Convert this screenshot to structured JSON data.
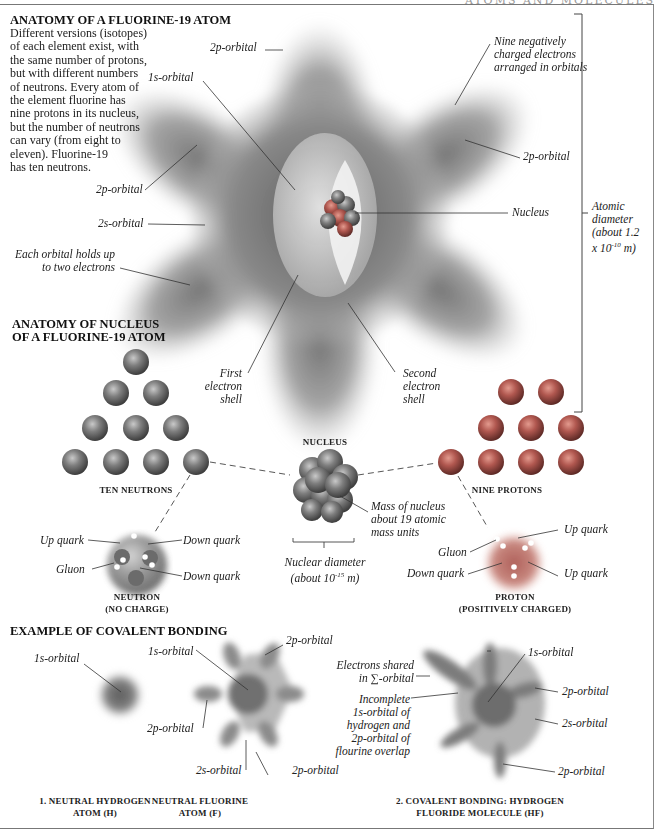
{
  "page": {
    "running_header": "ATOMS AND MOLECULES"
  },
  "atom_section": {
    "title": "ANATOMY OF A FLUORINE-19 ATOM",
    "description_lines": [
      "Different versions (isotopes)",
      "of each element exist, with",
      "the same number of protons,",
      "but with different numbers",
      "of neutrons. Every atom of",
      "the element fluorine has",
      "nine protons in its nucleus,",
      "but the number of neutrons",
      "can vary (from eight to",
      "eleven). Fluorine-19",
      "has ten neutrons."
    ],
    "labels": {
      "p2_top": "2p-orbital",
      "s1": "1s-orbital",
      "electrons": [
        "Nine negatively",
        "charged electrons",
        "arranged in orbitals"
      ],
      "p2_right": "2p-orbital",
      "p2_left": "2p-orbital",
      "s2": "2s-orbital",
      "nucleus": "Nucleus",
      "each_orbital": [
        "Each orbital holds up",
        "to two electrons"
      ],
      "first_shell": [
        "First",
        "electron",
        "shell"
      ],
      "second_shell": [
        "Second",
        "electron",
        "shell"
      ],
      "diameter": [
        "Atomic",
        "diameter",
        "(about 1.2",
        "x 10",
        "-10",
        " m)"
      ]
    }
  },
  "nucleus_section": {
    "title_lines": [
      "ANATOMY OF NUCLEUS",
      "OF A FLUORINE-19 ATOM"
    ],
    "neutrons_caption": "TEN NEUTRONS",
    "protons_caption": "NINE PROTONS",
    "nucleus_caption": "NUCLEUS",
    "mass_label": [
      "Mass of nucleus",
      "about 19 atomic",
      "mass units"
    ],
    "diameter_label": [
      "Nuclear diameter",
      "(about 10",
      "-15",
      " m)"
    ],
    "neutron_detail": {
      "labels": {
        "up_quark": "Up quark",
        "down_quark_1": "Down quark",
        "gluon": "Gluon",
        "down_quark_2": "Down quark"
      },
      "caption": [
        "NEUTRON",
        "(NO CHARGE)"
      ]
    },
    "proton_detail": {
      "labels": {
        "up_quark_1": "Up quark",
        "gluon": "Gluon",
        "down_quark": "Down quark",
        "up_quark_2": "Up quark"
      },
      "caption": [
        "PROTON",
        "(POSITIVELY CHARGED)"
      ]
    },
    "neutron_count": 10,
    "proton_count": 9
  },
  "bonding_section": {
    "title": "EXAMPLE OF COVALENT BONDING",
    "hydrogen": {
      "label_1s": "1s-orbital",
      "caption": [
        "1. NEUTRAL HYDROGEN",
        "ATOM (H)"
      ]
    },
    "fluorine": {
      "label_1s": "1s-orbital",
      "label_2p_top": "2p-orbital",
      "label_2p_left": "2p-orbital",
      "label_2s": "2s-orbital",
      "label_2p_bottom": "2p-orbital",
      "caption": [
        "NEUTRAL FLUORINE",
        "ATOM (F)"
      ]
    },
    "molecule": {
      "shared": [
        "Electrons shared",
        "in ∑-orbital"
      ],
      "incomplete": [
        "Incomplete",
        "1s-orbital of",
        "hydrogen and",
        "2p-orbital of",
        "flourine overlap"
      ],
      "label_1s": "1s-orbital",
      "label_2p_right": "2p-orbital",
      "label_2s": "2s-orbital",
      "label_2p_bottom": "2p-orbital",
      "caption": [
        "2. COVALENT BONDING: HYDROGEN",
        "FLUORIDE MOLECULE (HF)"
      ]
    }
  },
  "colors": {
    "orbital_gray": "#8a8a8a",
    "sphere_red": "#b0574f",
    "sphere_gray": "#777777",
    "leader_line": "#333333"
  }
}
